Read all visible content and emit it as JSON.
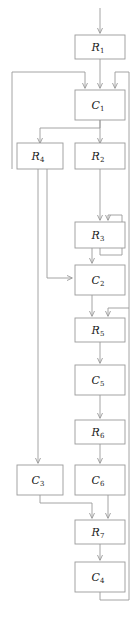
{
  "diagram": {
    "type": "flowchart",
    "stroke_color": "#9a9a9a",
    "fill_color": "#ffffff",
    "text_color": "#1a1a1a",
    "canvas": {
      "width": 136,
      "height": 627
    }
  },
  "nodes": [
    {
      "id": "R1",
      "base": "R",
      "sub": "1",
      "label": "R1",
      "x": 75,
      "y": 35,
      "w": 50,
      "h": 24
    },
    {
      "id": "C1",
      "base": "C",
      "sub": "1",
      "label": "C1",
      "x": 75,
      "y": 90,
      "w": 50,
      "h": 30
    },
    {
      "id": "R4",
      "base": "R",
      "sub": "4",
      "label": "R4",
      "x": 17,
      "y": 145,
      "w": 46,
      "h": 24
    },
    {
      "id": "R2",
      "base": "R",
      "sub": "2",
      "label": "R2",
      "x": 75,
      "y": 145,
      "w": 50,
      "h": 24
    },
    {
      "id": "R3",
      "base": "R",
      "sub": "3",
      "label": "R3",
      "x": 75,
      "y": 222,
      "w": 50,
      "h": 24
    },
    {
      "id": "C2",
      "base": "C",
      "sub": "2",
      "label": "C2",
      "x": 75,
      "y": 265,
      "w": 50,
      "h": 30
    },
    {
      "id": "R5",
      "base": "R",
      "sub": "5",
      "label": "R5",
      "x": 75,
      "y": 318,
      "w": 50,
      "h": 24
    },
    {
      "id": "C5",
      "base": "C",
      "sub": "5",
      "label": "C5",
      "x": 75,
      "y": 365,
      "w": 50,
      "h": 30
    },
    {
      "id": "R6",
      "base": "R",
      "sub": "6",
      "label": "R6",
      "x": 75,
      "y": 420,
      "w": 50,
      "h": 24
    },
    {
      "id": "C3",
      "base": "C",
      "sub": "3",
      "label": "C3",
      "x": 17,
      "y": 465,
      "w": 46,
      "h": 30
    },
    {
      "id": "C6",
      "base": "C",
      "sub": "6",
      "label": "C6",
      "x": 75,
      "y": 465,
      "w": 50,
      "h": 30
    },
    {
      "id": "R7",
      "base": "R",
      "sub": "7",
      "label": "R7",
      "x": 75,
      "y": 520,
      "w": 50,
      "h": 24
    },
    {
      "id": "C4",
      "base": "C",
      "sub": "4",
      "label": "C4",
      "x": 75,
      "y": 562,
      "w": 50,
      "h": 30
    }
  ],
  "edges": [
    {
      "id": "entry-to-R1",
      "from": "entry",
      "to": "R1"
    },
    {
      "id": "R1-to-C1",
      "from": "R1",
      "to": "C1"
    },
    {
      "id": "left-loop-to-C1",
      "from": "R4",
      "to": "C1"
    },
    {
      "id": "right-loop-to-C1",
      "from": "C4",
      "to": "C1"
    },
    {
      "id": "C1-to-R4",
      "from": "C1",
      "to": "R4"
    },
    {
      "id": "C1-to-R2",
      "from": "C1",
      "to": "R2"
    },
    {
      "id": "R2-to-R3",
      "from": "R2",
      "to": "R3"
    },
    {
      "id": "R3-self-loop",
      "from": "R3",
      "to": "R3"
    },
    {
      "id": "R3-to-C2",
      "from": "R3",
      "to": "C2"
    },
    {
      "id": "R4-to-C2",
      "from": "R4",
      "to": "C2"
    },
    {
      "id": "C2-to-R5",
      "from": "C2",
      "to": "R5"
    },
    {
      "id": "return-to-R5",
      "from": "C4",
      "to": "R5"
    },
    {
      "id": "R5-to-C5",
      "from": "R5",
      "to": "C5"
    },
    {
      "id": "C5-to-R6",
      "from": "C5",
      "to": "R6"
    },
    {
      "id": "R6-to-C6",
      "from": "R6",
      "to": "C6"
    },
    {
      "id": "R4-to-C3",
      "from": "R4",
      "to": "C3"
    },
    {
      "id": "C3-to-R7",
      "from": "C3",
      "to": "R7"
    },
    {
      "id": "C6-to-R7",
      "from": "C6",
      "to": "R7"
    },
    {
      "id": "R7-to-C4",
      "from": "R7",
      "to": "C4"
    },
    {
      "id": "C4-to-exit",
      "from": "C4",
      "to": "return"
    }
  ]
}
